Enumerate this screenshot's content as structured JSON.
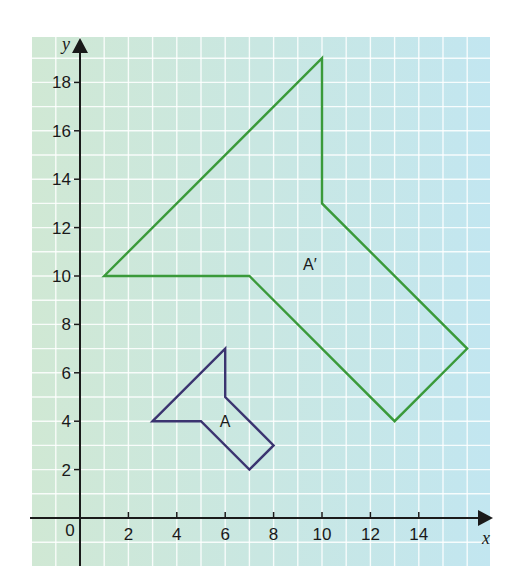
{
  "chart_data": {
    "type": "line",
    "title": "",
    "xlabel": "x",
    "ylabel": "y",
    "xlim": [
      -2,
      17
    ],
    "ylim": [
      -2,
      20
    ],
    "grid": true,
    "grid_step": 1,
    "x_ticks": [
      2,
      4,
      6,
      8,
      10,
      12,
      14
    ],
    "y_ticks": [
      2,
      4,
      6,
      8,
      10,
      12,
      14,
      16,
      18
    ],
    "origin_label": "0",
    "series": [
      {
        "name": "A",
        "label": "A",
        "color": "#3b3470",
        "closed": true,
        "points": [
          [
            3,
            4
          ],
          [
            6,
            7
          ],
          [
            6,
            5
          ],
          [
            8,
            3
          ],
          [
            7,
            2
          ],
          [
            5,
            4
          ]
        ],
        "label_pos": [
          6,
          4
        ]
      },
      {
        "name": "A'",
        "label": "A′",
        "color": "#3a9a3a",
        "closed": true,
        "points": [
          [
            1,
            10
          ],
          [
            10,
            19
          ],
          [
            10,
            13
          ],
          [
            16,
            7
          ],
          [
            13,
            4
          ],
          [
            7,
            10
          ]
        ],
        "label_pos": [
          9.5,
          10.5
        ]
      }
    ]
  },
  "colors": {
    "grid_bg_left": "#cfe8d6",
    "grid_bg_right": "#c4e6ef",
    "grid_line": "#ffffff",
    "axis": "#1a1a1a"
  }
}
